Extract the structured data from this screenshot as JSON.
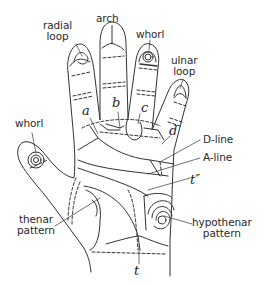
{
  "diagram": {
    "line_color": "#333333",
    "background": "#ffffff",
    "fingertip_labels": {
      "radial_loop": [
        "radial",
        "loop"
      ],
      "arch": "arch",
      "whorl_middle": "whorl",
      "ulnar_loop": [
        "ulnar",
        "loop"
      ],
      "whorl_thumb": "whorl"
    },
    "triradii": {
      "a": "a",
      "b": "b",
      "c": "c",
      "d": "d",
      "t_double_prime": "t″",
      "t": "t"
    },
    "lines": {
      "d_line": "D-line",
      "a_line": "A-line"
    },
    "patterns": {
      "thenar": [
        "thenar",
        "pattern"
      ],
      "hypothenar": [
        "hypothenar",
        "pattern"
      ]
    }
  }
}
